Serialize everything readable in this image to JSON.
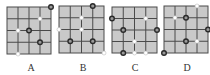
{
  "colors": {
    "grid_fill": "#c9c9c9",
    "grid_line": "#4a4a4a",
    "dark_dot_stroke": "#2a2a2a",
    "dark_dot_fill": "#9a9a9a",
    "white_dot_fill": "#ffffff",
    "white_dot_stroke": "#bdbdbd",
    "label": "#333333"
  },
  "grid": {
    "rows": 4,
    "cols": 4
  },
  "options": [
    {
      "label": "A",
      "box": {
        "x": 7,
        "y": 7,
        "w": 44,
        "h": 47
      },
      "label_x": 31,
      "dots": [
        {
          "col": 4,
          "row": 0,
          "type": "dark"
        },
        {
          "col": 3,
          "row": 1,
          "type": "white"
        },
        {
          "col": 1,
          "row": 2,
          "type": "white"
        },
        {
          "col": 2,
          "row": 2,
          "type": "dark"
        },
        {
          "col": 3,
          "row": 3,
          "type": "dark"
        },
        {
          "col": 1,
          "row": 4,
          "type": "white"
        }
      ]
    },
    {
      "label": "B",
      "box": {
        "x": 59,
        "y": 6,
        "w": 45,
        "h": 47
      },
      "label_x": 83,
      "dots": [
        {
          "col": 3,
          "row": 0,
          "type": "dark"
        },
        {
          "col": 2,
          "row": 1,
          "type": "white"
        },
        {
          "col": 0,
          "row": 2,
          "type": "white"
        },
        {
          "col": 2,
          "row": 2,
          "type": "white"
        },
        {
          "col": 1,
          "row": 3,
          "type": "dark"
        },
        {
          "col": 3,
          "row": 3,
          "type": "dark"
        },
        {
          "col": 4,
          "row": 4,
          "type": "white"
        }
      ]
    },
    {
      "label": "C",
      "box": {
        "x": 112,
        "y": 7,
        "w": 45,
        "h": 46
      },
      "label_x": 135,
      "dots": [
        {
          "col": 0,
          "row": 1,
          "type": "dark"
        },
        {
          "col": 3,
          "row": 1,
          "type": "white"
        },
        {
          "col": 1,
          "row": 2,
          "type": "dark"
        },
        {
          "col": 4,
          "row": 2,
          "type": "dark"
        },
        {
          "col": 2,
          "row": 3,
          "type": "white"
        },
        {
          "col": 1,
          "row": 4,
          "type": "dark"
        },
        {
          "col": 2,
          "row": 4,
          "type": "white"
        },
        {
          "col": 3,
          "row": 4,
          "type": "white"
        }
      ]
    },
    {
      "label": "D",
      "box": {
        "x": 164,
        "y": 6,
        "w": 44,
        "h": 47
      },
      "label_x": 187,
      "dots": [
        {
          "col": 3,
          "row": 0,
          "type": "white"
        },
        {
          "col": 1,
          "row": 1,
          "type": "white"
        },
        {
          "col": 2,
          "row": 1,
          "type": "dark"
        },
        {
          "col": 4,
          "row": 2,
          "type": "dark"
        },
        {
          "col": 2,
          "row": 3,
          "type": "dark"
        },
        {
          "col": 3,
          "row": 3,
          "type": "white"
        },
        {
          "col": 0,
          "row": 4,
          "type": "dark"
        }
      ]
    }
  ]
}
